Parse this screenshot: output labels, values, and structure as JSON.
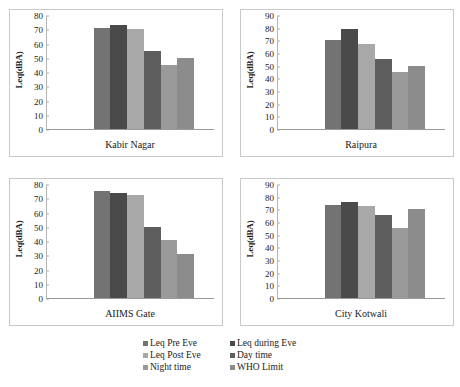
{
  "figure": {
    "title": "",
    "panel_count": 4
  },
  "series_names": [
    "Leq Pre Eve",
    "Leq during Eve",
    "Leq Post Eve",
    "Day time",
    "Night time",
    "WHO Limit"
  ],
  "series_colors": [
    "#737373",
    "#4a4a4a",
    "#a8a8a8",
    "#5e5e5e",
    "#9a9a9a",
    "#8c8c8c"
  ],
  "legend": {
    "position": "bottom",
    "columns": 2,
    "items": [
      {
        "label": "Leq Pre Eve",
        "color": "#737373"
      },
      {
        "label": "Leq during Eve",
        "color": "#4a4a4a"
      },
      {
        "label": "Leq Post Eve",
        "color": "#a8a8a8"
      },
      {
        "label": "Day time",
        "color": "#5e5e5e"
      },
      {
        "label": "Night time",
        "color": "#9a9a9a"
      },
      {
        "label": "WHO Limit",
        "color": "#8c8c8c"
      }
    ]
  },
  "chart_data": [
    {
      "type": "bar",
      "title": "Kabir Nagar",
      "xlabel": "Kabir Nagar",
      "ylabel": "Leq(dBA)",
      "categories": [
        "Leq Pre Eve",
        "Leq during Eve",
        "Leq Post Eve",
        "Day time",
        "Night time",
        "WHO Limit"
      ],
      "values": [
        71.5,
        73.5,
        71,
        55.5,
        45.5,
        50.5
      ],
      "ylim": [
        0,
        80
      ],
      "yticks": [
        0,
        10,
        20,
        30,
        40,
        50,
        60,
        70,
        80
      ],
      "ytick_labels": [
        "0",
        "10",
        "20",
        "30",
        "40",
        "50",
        "60",
        "70",
        "80"
      ],
      "grid": false
    },
    {
      "type": "bar",
      "title": "Raipura",
      "xlabel": "Raipura",
      "ylabel": "Leq(dBA)",
      "categories": [
        "Leq Pre Eve",
        "Leq during Eve",
        "Leq Post Eve",
        "Day time",
        "Night time",
        "WHO Limit"
      ],
      "values": [
        71,
        79.5,
        67.5,
        55.5,
        45.5,
        50.5
      ],
      "ylim": [
        0,
        90
      ],
      "yticks": [
        0,
        10,
        20,
        30,
        40,
        50,
        60,
        70,
        80,
        90
      ],
      "ytick_labels": [
        "0",
        "10",
        "20",
        "30",
        "40",
        "50",
        "60",
        "70",
        "80",
        "90"
      ],
      "grid": false
    },
    {
      "type": "bar",
      "title": "AIIMS Gate",
      "xlabel": "AIIMS Gate",
      "ylabel": "Leq(dBA)",
      "categories": [
        "Leq Pre Eve",
        "Leq during Eve",
        "Leq Post Eve",
        "Day time",
        "Night time",
        "WHO Limit"
      ],
      "values": [
        76,
        74.5,
        73,
        50.5,
        41,
        31
      ],
      "ylim": [
        0,
        80
      ],
      "yticks": [
        0,
        10,
        20,
        30,
        40,
        50,
        60,
        70,
        80
      ],
      "ytick_labels": [
        "0",
        "10",
        "20",
        "30",
        "40",
        "50",
        "60",
        "70",
        "80"
      ],
      "grid": false
    },
    {
      "type": "bar",
      "title": "City Kotwali",
      "xlabel": "City Kotwali",
      "ylabel": "Leq(dBA)",
      "categories": [
        "Leq Pre Eve",
        "Leq during Eve",
        "Leq Post Eve",
        "Day time",
        "Night time",
        "WHO Limit"
      ],
      "values": [
        74,
        76.5,
        73.5,
        66,
        55.5,
        71
      ],
      "ylim": [
        0,
        90
      ],
      "yticks": [
        0,
        10,
        20,
        30,
        40,
        50,
        60,
        70,
        80,
        90
      ],
      "ytick_labels": [
        "0",
        "10",
        "20",
        "30",
        "40",
        "50",
        "60",
        "70",
        "80",
        "90"
      ],
      "grid": false
    }
  ]
}
